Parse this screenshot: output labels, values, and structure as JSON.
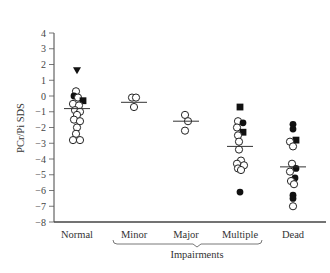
{
  "chart_data": {
    "type": "scatter",
    "title": "",
    "xlabel": "",
    "ylabel": "PCr/Pi SDS",
    "ylim": [
      -8,
      4
    ],
    "yticks": [
      4,
      3,
      2,
      1,
      0,
      -1,
      -2,
      -3,
      -4,
      -5,
      -6,
      -7,
      -8
    ],
    "grid": false,
    "legend": "none",
    "categories": [
      "Normal",
      "Minor",
      "Major",
      "Multiple",
      "Dead"
    ],
    "group_bracket": {
      "label": "Impairments",
      "spans": [
        "Minor",
        "Major",
        "Multiple"
      ]
    },
    "marker_types": {
      "open_circle": "circle-open",
      "filled_circle": "circle-filled",
      "filled_square": "square-filled",
      "filled_triangle": "triangle-down-filled"
    },
    "series": [
      {
        "name": "Normal",
        "mean": -0.8,
        "points": [
          {
            "y": 1.6,
            "m": "triangle",
            "dx": 0
          },
          {
            "y": 0.3,
            "m": "open",
            "dx": -1
          },
          {
            "y": 0.0,
            "m": "filled",
            "dx": -3
          },
          {
            "y": -0.1,
            "m": "open",
            "dx": 1
          },
          {
            "y": -0.3,
            "m": "square",
            "dx": 6
          },
          {
            "y": -0.5,
            "m": "open",
            "dx": -4
          },
          {
            "y": -0.6,
            "m": "open",
            "dx": 2
          },
          {
            "y": -0.9,
            "m": "open",
            "dx": -2
          },
          {
            "y": -1.0,
            "m": "open",
            "dx": 3
          },
          {
            "y": -1.2,
            "m": "open",
            "dx": 0
          },
          {
            "y": -1.5,
            "m": "open",
            "dx": -3
          },
          {
            "y": -1.6,
            "m": "open",
            "dx": 3
          },
          {
            "y": -2.0,
            "m": "open",
            "dx": 0
          },
          {
            "y": -2.4,
            "m": "open",
            "dx": -1
          },
          {
            "y": -2.8,
            "m": "open",
            "dx": -4
          },
          {
            "y": -2.8,
            "m": "open",
            "dx": 3
          }
        ]
      },
      {
        "name": "Minor",
        "mean": -0.4,
        "points": [
          {
            "y": -0.1,
            "m": "open",
            "dx": -2
          },
          {
            "y": -0.1,
            "m": "open",
            "dx": 2
          },
          {
            "y": -0.7,
            "m": "open",
            "dx": 0
          }
        ]
      },
      {
        "name": "Major",
        "mean": -1.6,
        "points": [
          {
            "y": -1.2,
            "m": "open",
            "dx": -1
          },
          {
            "y": -1.6,
            "m": "open",
            "dx": 2
          },
          {
            "y": -2.2,
            "m": "open",
            "dx": -1
          }
        ]
      },
      {
        "name": "Multiple",
        "mean": -3.2,
        "points": [
          {
            "y": -0.7,
            "m": "square",
            "dx": 0
          },
          {
            "y": -1.6,
            "m": "open",
            "dx": -2
          },
          {
            "y": -1.7,
            "m": "filled",
            "dx": 3
          },
          {
            "y": -2.0,
            "m": "open",
            "dx": -3
          },
          {
            "y": -2.3,
            "m": "square",
            "dx": 3
          },
          {
            "y": -2.5,
            "m": "open",
            "dx": -2
          },
          {
            "y": -2.9,
            "m": "open",
            "dx": -1
          },
          {
            "y": -3.4,
            "m": "open",
            "dx": -1
          },
          {
            "y": -4.1,
            "m": "open",
            "dx": 1
          },
          {
            "y": -4.3,
            "m": "open",
            "dx": -3
          },
          {
            "y": -4.4,
            "m": "open",
            "dx": 4
          },
          {
            "y": -4.6,
            "m": "open",
            "dx": -2
          },
          {
            "y": -4.7,
            "m": "open",
            "dx": 1
          },
          {
            "y": -6.1,
            "m": "filled",
            "dx": 0
          }
        ]
      },
      {
        "name": "Dead",
        "mean": -4.5,
        "points": [
          {
            "y": -1.8,
            "m": "filled",
            "dx": 0
          },
          {
            "y": -2.1,
            "m": "filled",
            "dx": 0
          },
          {
            "y": -2.8,
            "m": "square",
            "dx": 3
          },
          {
            "y": -2.9,
            "m": "open",
            "dx": -3
          },
          {
            "y": -3.2,
            "m": "open",
            "dx": 0
          },
          {
            "y": -4.3,
            "m": "open",
            "dx": -1
          },
          {
            "y": -4.6,
            "m": "filled",
            "dx": 3
          },
          {
            "y": -4.8,
            "m": "open",
            "dx": -3
          },
          {
            "y": -5.2,
            "m": "filled",
            "dx": 2
          },
          {
            "y": -5.4,
            "m": "open",
            "dx": -2
          },
          {
            "y": -5.6,
            "m": "open",
            "dx": 1
          },
          {
            "y": -6.3,
            "m": "filled",
            "dx": 0
          },
          {
            "y": -6.5,
            "m": "filled",
            "dx": 0
          },
          {
            "y": -7.0,
            "m": "open",
            "dx": 0
          }
        ]
      }
    ]
  },
  "labels": {
    "ylabel": "PCr/Pi SDS",
    "group": "Impairments",
    "categories": [
      "Normal",
      "Minor",
      "Major",
      "Multiple",
      "Dead"
    ]
  }
}
